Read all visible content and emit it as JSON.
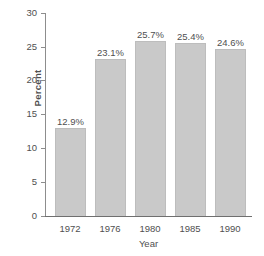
{
  "chart_data": {
    "type": "bar",
    "title": "",
    "subtitle": "",
    "xlabel": "Year",
    "ylabel": "Percent",
    "categories": [
      "1972",
      "1976",
      "1980",
      "1985",
      "1990"
    ],
    "values": [
      12.9,
      23.1,
      25.7,
      25.4,
      24.6
    ],
    "data_labels": [
      "12.9%",
      "23.1%",
      "25.7%",
      "25.4%",
      "24.6%"
    ],
    "ylim": [
      0,
      30
    ],
    "ytick_values": [
      0,
      5,
      10,
      15,
      20,
      25,
      30
    ],
    "ytick_labels": [
      "0",
      "5",
      "10",
      "15",
      "20",
      "25",
      "30"
    ],
    "grid": false,
    "legend": null,
    "legend_position": "none",
    "colors": {
      "bar_fill": "#c9c9c9",
      "bar_edge": "#bdbdbd",
      "axis": "#8d8d8d",
      "text": "#4f4f4f",
      "background": "#ffffff"
    }
  }
}
